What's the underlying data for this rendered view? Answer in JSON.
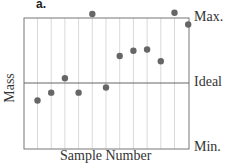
{
  "panel_label": "a.",
  "chart_data": {
    "type": "scatter",
    "title": "",
    "xlabel": "Sample Number",
    "ylabel": "Mass",
    "y_reference_labels": [
      "Max.",
      "Ideal",
      "Min."
    ],
    "y_reference_values": [
      100,
      50,
      0
    ],
    "ylim": [
      0,
      100
    ],
    "grid": "vertical",
    "x": [
      1,
      2,
      3,
      4,
      5,
      6,
      7,
      8,
      9,
      10,
      11,
      12
    ],
    "values": [
      37,
      43,
      54,
      43,
      103,
      47,
      71,
      75,
      76,
      67,
      104,
      95
    ]
  },
  "labels": {
    "max": "Max.",
    "ideal": "Ideal",
    "min": "Min.",
    "x_axis": "Sample Number",
    "y_axis": "Mass"
  }
}
